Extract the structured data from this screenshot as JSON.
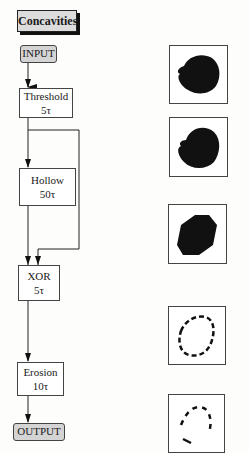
{
  "title": "Concavities",
  "io": {
    "input": "INPUT",
    "output": "OUTPUT"
  },
  "steps": [
    {
      "name": "Threshold",
      "cost": "5τ"
    },
    {
      "name": "Hollow",
      "cost": "50τ"
    },
    {
      "name": "XOR",
      "cost": "5τ"
    },
    {
      "name": "Erosion",
      "cost": "10τ"
    }
  ],
  "images": [
    {
      "desc": "input blob (filled)"
    },
    {
      "desc": "thresholded blob (filled)"
    },
    {
      "desc": "hollow / convex filled blob"
    },
    {
      "desc": "XOR concavity outline (dashed)"
    },
    {
      "desc": "eroded concavity fragments"
    }
  ]
}
